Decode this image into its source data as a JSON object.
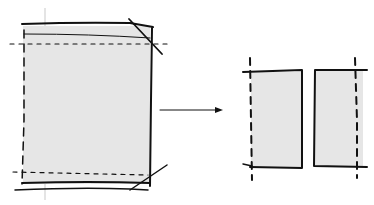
{
  "diagram": {
    "colors": {
      "ink": "#111111",
      "panel_fill": "#e6e6e6",
      "background": "#ffffff",
      "guide": "#bbbbbb"
    },
    "elements": [
      {
        "id": "source-panel",
        "kind": "shaded rectangle with folded top and bottom hems and dashed stitch lines"
      },
      {
        "id": "arrow",
        "kind": "right-pointing arrow"
      },
      {
        "id": "result-panel-left",
        "kind": "shaded rectangle with dashed left edge"
      },
      {
        "id": "result-panel-right",
        "kind": "shaded rectangle with dashed right edge"
      }
    ]
  }
}
